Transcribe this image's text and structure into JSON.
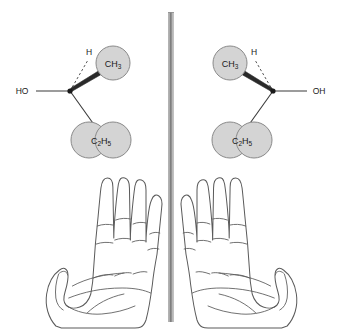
{
  "figure": {
    "background_color": "#ffffff",
    "width": 343,
    "height": 332
  },
  "mirror": {
    "name": "mirror-plane",
    "orientation": "vertical",
    "x": 171,
    "y_top": 12,
    "y_bottom": 322,
    "color_light": "#c9c9c9",
    "color_dark": "#6f6f6f"
  },
  "colors": {
    "group_fill": "#d4d4d4",
    "group_stroke": "#8a8a8a",
    "bond": "#3a3a3a",
    "text": "#1a1a1a",
    "hand_outline": "#5a5a5a"
  },
  "molecules": [
    {
      "id": "left-enantiomer",
      "name": "left-molecule",
      "side": "left",
      "stereocenter": {
        "x": 70,
        "y": 91
      },
      "substituents": [
        {
          "id": "hydroxyl",
          "label": "HO",
          "label_parts": [
            {
              "text": "HO",
              "sub": false
            }
          ],
          "bond_type": "plain",
          "shape": "text",
          "direction": "left",
          "label_x": 22,
          "label_y": 94,
          "bond_end": {
            "x": 36,
            "y": 91
          }
        },
        {
          "id": "hydrogen",
          "label": "H",
          "label_parts": [
            {
              "text": "H",
              "sub": false
            }
          ],
          "bond_type": "dashed",
          "shape": "text",
          "direction": "upper-left",
          "label_x": 89,
          "label_y": 55,
          "bond_end": {
            "x": 88,
            "y": 60
          }
        },
        {
          "id": "methyl",
          "label": "CH3",
          "label_parts": [
            {
              "text": "CH",
              "sub": false
            },
            {
              "text": "3",
              "sub": true
            }
          ],
          "bond_type": "wedge",
          "shape": "circle",
          "direction": "upper-right",
          "center": {
            "x": 113,
            "y": 63
          },
          "radius": 17
        },
        {
          "id": "ethyl",
          "label": "C2H5",
          "label_parts": [
            {
              "text": "C",
              "sub": false
            },
            {
              "text": "2",
              "sub": true
            },
            {
              "text": "H",
              "sub": false
            },
            {
              "text": "5",
              "sub": true
            }
          ],
          "bond_type": "plain",
          "shape": "double-circle",
          "direction": "down",
          "center": {
            "x": 101,
            "y": 140
          },
          "radius": 18,
          "lobe_offset": 12
        }
      ]
    },
    {
      "id": "right-enantiomer",
      "name": "right-molecule",
      "side": "right",
      "stereocenter": {
        "x": 273,
        "y": 91
      },
      "substituents": [
        {
          "id": "hydroxyl",
          "label": "OH",
          "label_parts": [
            {
              "text": "OH",
              "sub": false
            }
          ],
          "bond_type": "plain",
          "shape": "text",
          "direction": "right",
          "label_x": 312,
          "label_y": 94,
          "bond_end": {
            "x": 307,
            "y": 91
          }
        },
        {
          "id": "hydrogen",
          "label": "H",
          "label_parts": [
            {
              "text": "H",
              "sub": false
            }
          ],
          "bond_type": "dashed",
          "shape": "text",
          "direction": "upper-right",
          "label_x": 254,
          "label_y": 55,
          "bond_end": {
            "x": 255,
            "y": 60
          }
        },
        {
          "id": "methyl",
          "label": "CH3",
          "label_parts": [
            {
              "text": "CH",
              "sub": false
            },
            {
              "text": "3",
              "sub": true
            }
          ],
          "bond_type": "wedge",
          "shape": "circle",
          "direction": "upper-left",
          "center": {
            "x": 230,
            "y": 63
          },
          "radius": 17
        },
        {
          "id": "ethyl",
          "label": "C2H5",
          "label_parts": [
            {
              "text": "C",
              "sub": false
            },
            {
              "text": "2",
              "sub": true
            },
            {
              "text": "H",
              "sub": false
            },
            {
              "text": "5",
              "sub": true
            }
          ],
          "bond_type": "plain",
          "shape": "double-circle",
          "direction": "down",
          "center": {
            "x": 242,
            "y": 140
          },
          "radius": 18,
          "lobe_offset": 12
        }
      ]
    }
  ],
  "hands": [
    {
      "id": "left-hand",
      "name": "left-hand-illustration",
      "side": "left",
      "view": "palm",
      "thumb_direction": "left",
      "bounds": {
        "x": 8,
        "y": 178,
        "width": 150,
        "height": 150
      }
    },
    {
      "id": "right-hand",
      "name": "right-hand-illustration",
      "side": "right",
      "view": "palm",
      "thumb_direction": "right",
      "bounds": {
        "x": 185,
        "y": 178,
        "width": 150,
        "height": 150
      }
    }
  ]
}
